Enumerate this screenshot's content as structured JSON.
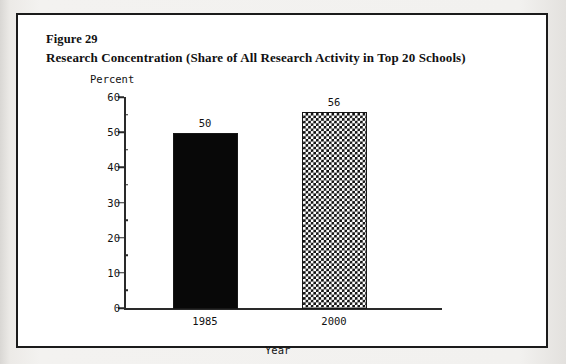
{
  "figure": {
    "number_label": "Figure 29",
    "caption": "Research Concentration (Share of All Research Activity in Top 20 Schools)"
  },
  "chart_data": {
    "type": "bar",
    "title": "Research Concentration (Share of All Research Activity in Top 20 Schools)",
    "categories": [
      "1985",
      "2000"
    ],
    "values": [
      50,
      56
    ],
    "data_labels": [
      "50",
      "56"
    ],
    "xlabel": "Year",
    "ylabel": "Percent",
    "ylim": [
      0,
      60
    ],
    "yticks": [
      0,
      10,
      20,
      30,
      40,
      50,
      60
    ],
    "ytick_labels": [
      "0",
      "10",
      "20",
      "30",
      "40",
      "50",
      "60"
    ],
    "yminor_ticks": [
      5,
      15,
      25,
      35,
      45,
      55
    ],
    "grid": false,
    "legend": "none",
    "series": [
      {
        "name": "1985",
        "value": 50,
        "label": "50",
        "fill": "solid-black",
        "color": "#080808"
      },
      {
        "name": "2000",
        "value": 56,
        "label": "56",
        "fill": "checkerboard",
        "color": "#101010"
      }
    ]
  },
  "colors": {
    "frame": "#1b1b1b",
    "axis": "#2a2a2a",
    "ink": "#111111",
    "paper": "#ffffff",
    "scan_background": "#efeeec"
  }
}
